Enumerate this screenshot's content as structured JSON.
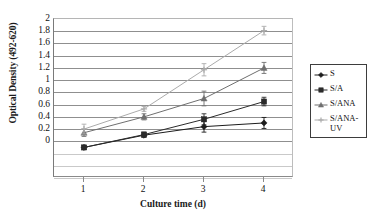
{
  "chart_data": {
    "type": "line",
    "title": "",
    "xlabel": "Culture time (d)",
    "ylabel": "Optical Density (492-620)",
    "x": [
      1,
      2,
      3,
      4
    ],
    "xtick_labels": [
      "1",
      "2",
      "3",
      "4"
    ],
    "xlim": [
      0.5,
      4.5
    ],
    "ylim": [
      -0.6,
      2.0
    ],
    "ytick_labels": [
      "2",
      "1.8",
      "1.6",
      "1.4",
      "1.2",
      "1",
      "0.8",
      "0.6",
      "0.4",
      "0.2",
      "0"
    ],
    "ytick_values": [
      2.0,
      1.8,
      1.6,
      1.4,
      1.2,
      1.0,
      0.8,
      0.6,
      0.4,
      0.2,
      0.0
    ],
    "unlabeled_gridlines": [
      -0.2,
      -0.4,
      -0.6
    ],
    "grid": true,
    "legend_position": "right-outside",
    "series": [
      {
        "name": "S",
        "marker": "diamond",
        "color": "#1c1c1c",
        "values": [
          -0.1,
          0.1,
          0.24,
          0.3
        ],
        "errors": [
          0.03,
          0.03,
          0.09,
          0.09
        ]
      },
      {
        "name": "S/A",
        "marker": "square",
        "color": "#2b2b2b",
        "values": [
          -0.1,
          0.11,
          0.36,
          0.65
        ],
        "errors": [
          0.03,
          0.04,
          0.09,
          0.07
        ]
      },
      {
        "name": "S/ANA",
        "marker": "triangle",
        "color": "#6f6f6f",
        "values": [
          0.14,
          0.4,
          0.7,
          1.2
        ],
        "errors": [
          0.06,
          0.05,
          0.12,
          0.09
        ]
      },
      {
        "name": "S/ANA-UV",
        "marker": "plus",
        "color": "#ababab",
        "values": [
          0.2,
          0.53,
          1.17,
          1.81
        ],
        "errors": [
          0.08,
          0.04,
          0.1,
          0.07
        ]
      }
    ]
  },
  "legend": {
    "entries": [
      {
        "label": "S"
      },
      {
        "label": "S/A"
      },
      {
        "label": "S/ANA"
      },
      {
        "label": "S/ANA-UV"
      }
    ]
  },
  "colors": {
    "series_1": "#1c1c1c",
    "series_2": "#2b2b2b",
    "series_3": "#6f6f6f",
    "series_4": "#ababab",
    "gridline": "#8f8f8f",
    "axis": "#8a8a8a",
    "legend_border": "#3d3d3d",
    "background": "#ffffff"
  }
}
